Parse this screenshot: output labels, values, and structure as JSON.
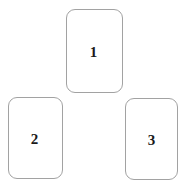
{
  "canvas": {
    "background_color": "#ffffff",
    "width": 186,
    "height": 187
  },
  "style": {
    "card_border_color": "#a2a2a2",
    "card_fill_color": "#ffffff",
    "label_color": "#1a1a1a"
  },
  "cards": [
    {
      "id": "card-1",
      "label": "1",
      "position": "top-center"
    },
    {
      "id": "card-2",
      "label": "2",
      "position": "bottom-left"
    },
    {
      "id": "card-3",
      "label": "3",
      "position": "bottom-right"
    }
  ]
}
